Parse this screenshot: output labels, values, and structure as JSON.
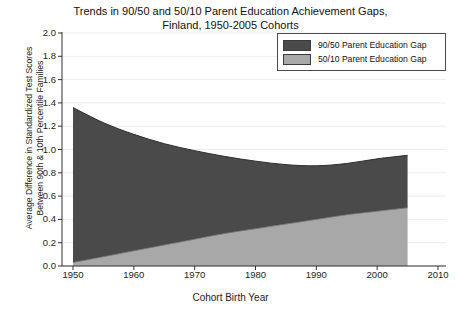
{
  "chart_data": {
    "type": "area",
    "title": "Trends in 90/50 and 50/10 Parent Education Achievement Gaps, Finland, 1950-2005 Cohorts",
    "title_line1": "Trends in 90/50 and 50/10 Parent Education Achievement Gaps,",
    "title_line2": "Finland, 1950-2005 Cohorts",
    "xlabel": "Cohort Birth Year",
    "ylabel": "Average Difference in Standardized Test Scores Between 90th & 10th Percentile Families",
    "ylabel_line1": "Average Difference in Standardized Test Scores",
    "ylabel_line2": "Between 90th & 10th Percentile Families",
    "xlim": [
      1950,
      2010
    ],
    "ylim": [
      0.0,
      2.0
    ],
    "xticks": [
      1950,
      1960,
      1970,
      1980,
      1990,
      2000,
      2010
    ],
    "xtick_labels": [
      "1950",
      "1960",
      "1970",
      "1980",
      "1990",
      "2000",
      "2010"
    ],
    "yticks": [
      0.0,
      0.2,
      0.4,
      0.6,
      0.8,
      1.0,
      1.2,
      1.4,
      1.6,
      1.8,
      2.0
    ],
    "ytick_labels": [
      "0.0",
      "0.2",
      "0.4",
      "0.6",
      "0.8",
      "1.0",
      "1.2",
      "1.4",
      "1.6",
      "1.8",
      "2.0"
    ],
    "grid": true,
    "stacked": true,
    "legend_position": "top-right",
    "x": [
      1950,
      1955,
      1960,
      1965,
      1970,
      1975,
      1980,
      1985,
      1990,
      1995,
      2000,
      2005
    ],
    "series": [
      {
        "name": "50/10 Parent Education Gap",
        "color": "#a8a8a8",
        "values": [
          0.03,
          0.08,
          0.13,
          0.18,
          0.23,
          0.28,
          0.32,
          0.36,
          0.4,
          0.44,
          0.47,
          0.5
        ]
      },
      {
        "name": "90/50 Parent Education Gap",
        "color": "#4a4a4a",
        "values": [
          1.33,
          1.15,
          1.0,
          0.87,
          0.76,
          0.66,
          0.58,
          0.51,
          0.46,
          0.44,
          0.45,
          0.45
        ]
      }
    ],
    "cumulative_top": [
      1.36,
      1.23,
      1.13,
      1.05,
      0.99,
      0.94,
      0.9,
      0.87,
      0.86,
      0.88,
      0.92,
      0.95
    ],
    "legend_entries": [
      {
        "label": "90/50 Parent Education Gap",
        "color": "#4a4a4a"
      },
      {
        "label": "50/10 Parent Education Gap",
        "color": "#a8a8a8"
      }
    ]
  }
}
